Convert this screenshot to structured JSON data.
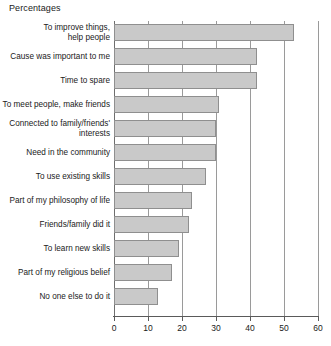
{
  "chart_data": {
    "type": "bar",
    "orientation": "horizontal",
    "title": "Percentages",
    "xlabel": "",
    "ylabel": "",
    "xlim": [
      0,
      60
    ],
    "xticks": [
      0,
      10,
      20,
      30,
      40,
      50,
      60
    ],
    "xtick_labels": [
      "0",
      "10",
      "20",
      "30",
      "40",
      "50",
      "60"
    ],
    "grid": true,
    "legend": "none",
    "bar_color": "#c9c9c9",
    "bar_border_color": "#8f8f8f",
    "categories": [
      "To improve things,\nhelp people",
      "Cause was important to me",
      "Time to spare",
      "To meet people, make friends",
      "Connected to family/friends'\ninterests",
      "Need in the community",
      "To use existing skills",
      "Part of my philosophy of life",
      "Friends/family did it",
      "To learn new skills",
      "Part of my religious belief",
      "No one else to do it"
    ],
    "values": [
      53,
      42,
      42,
      31,
      30,
      30,
      27,
      23,
      22,
      19,
      17,
      13
    ]
  }
}
